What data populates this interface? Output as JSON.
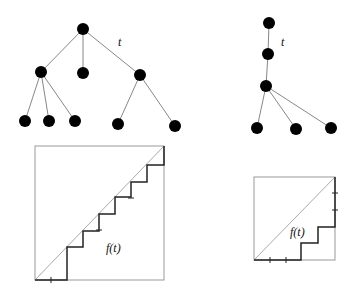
{
  "left_tree": {
    "edge_label": "t",
    "nodes": [
      [
        83,
        29
      ],
      [
        41,
        72
      ],
      [
        83,
        73
      ],
      [
        140,
        75
      ],
      [
        25,
        121
      ],
      [
        49,
        121
      ],
      [
        75,
        121
      ],
      [
        118,
        124
      ],
      [
        175,
        126
      ]
    ],
    "edges": [
      [
        0,
        1
      ],
      [
        0,
        2
      ],
      [
        0,
        3
      ],
      [
        1,
        4
      ],
      [
        1,
        5
      ],
      [
        1,
        6
      ],
      [
        3,
        7
      ],
      [
        3,
        8
      ]
    ]
  },
  "right_tree": {
    "edge_label": "t",
    "nodes": [
      [
        269,
        23
      ],
      [
        268,
        54
      ],
      [
        266,
        86
      ],
      [
        257,
        128
      ],
      [
        296,
        129
      ],
      [
        331,
        128
      ]
    ],
    "edges": [
      [
        0,
        1
      ],
      [
        1,
        2
      ],
      [
        2,
        3
      ],
      [
        2,
        4
      ],
      [
        2,
        5
      ]
    ]
  },
  "left_plot": {
    "function_label": "f(t)",
    "box": [
      35,
      146,
      164,
      280
    ],
    "staircase": "35,280 67,280 67,247 83,247 83,231 99,231 99,214 115,214 115,197 131,197 131,182 147,182 147,165 164,165 164,146",
    "ticks": [
      [
        51,
        280,
        "v"
      ],
      [
        99,
        230,
        "h"
      ],
      [
        131,
        198,
        "h"
      ]
    ]
  },
  "right_plot": {
    "function_label": "f(t)",
    "box": [
      254,
      177,
      335,
      260
    ],
    "staircase": "254,260 301,260 301,243 318,243 318,227 335,227 335,177",
    "ticks": [
      [
        270,
        260,
        "v"
      ],
      [
        286,
        260,
        "v"
      ],
      [
        335,
        193,
        "h"
      ],
      [
        335,
        210,
        "h"
      ]
    ]
  }
}
